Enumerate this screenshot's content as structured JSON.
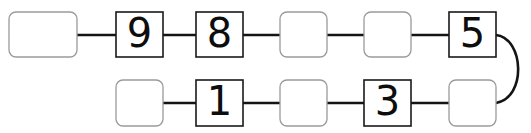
{
  "diagram": {
    "type": "linked-boxes-chain",
    "title": "",
    "canvas": {
      "width": 531,
      "height": 133,
      "background": "#ffffff"
    },
    "style": {
      "digit_border_color": "#1a1a1a",
      "empty_border_color": "#9a9a9a",
      "connector_color": "#141414",
      "box_fill": "#ffffff"
    },
    "rows": [
      {
        "name": "top-row",
        "y": 12,
        "height": 45,
        "cells": [
          {
            "index": 0,
            "value": "",
            "filled": false,
            "x": 9,
            "width": 68,
            "rounded": true,
            "label": "empty-box"
          },
          {
            "index": 1,
            "value": "9",
            "filled": true,
            "x": 116,
            "width": 47,
            "rounded": false,
            "label": "digit-box-9"
          },
          {
            "index": 2,
            "value": "8",
            "filled": true,
            "x": 196,
            "width": 47,
            "rounded": false,
            "label": "digit-box-8"
          },
          {
            "index": 3,
            "value": "",
            "filled": false,
            "x": 280,
            "width": 47,
            "rounded": true,
            "label": "empty-box"
          },
          {
            "index": 4,
            "value": "",
            "filled": false,
            "x": 364,
            "width": 47,
            "rounded": true,
            "label": "empty-box"
          },
          {
            "index": 5,
            "value": "5",
            "filled": true,
            "x": 449,
            "width": 47,
            "rounded": false,
            "label": "digit-box-5"
          }
        ]
      },
      {
        "name": "bottom-row",
        "y": 80,
        "height": 46,
        "cells": [
          {
            "index": 0,
            "value": "",
            "filled": false,
            "x": 116,
            "width": 47,
            "rounded": true,
            "label": "empty-box"
          },
          {
            "index": 1,
            "value": "1",
            "filled": true,
            "x": 196,
            "width": 47,
            "rounded": false,
            "label": "digit-box-1"
          },
          {
            "index": 2,
            "value": "",
            "filled": false,
            "x": 280,
            "width": 47,
            "rounded": true,
            "label": "empty-box"
          },
          {
            "index": 3,
            "value": "3",
            "filled": true,
            "x": 364,
            "width": 47,
            "rounded": false,
            "label": "digit-box-3"
          },
          {
            "index": 4,
            "value": "",
            "filled": false,
            "x": 449,
            "width": 47,
            "rounded": true,
            "label": "empty-box"
          }
        ]
      }
    ],
    "connectors": [
      {
        "name": "top-link-0-1",
        "x1": 77,
        "x2": 116,
        "y": 35
      },
      {
        "name": "top-link-1-2",
        "x1": 163,
        "x2": 196,
        "y": 35
      },
      {
        "name": "top-link-2-3",
        "x1": 243,
        "x2": 280,
        "y": 35
      },
      {
        "name": "top-link-3-4",
        "x1": 327,
        "x2": 364,
        "y": 35
      },
      {
        "name": "top-link-4-5",
        "x1": 411,
        "x2": 449,
        "y": 35
      },
      {
        "name": "bottom-link-0-1",
        "x1": 163,
        "x2": 196,
        "y": 103
      },
      {
        "name": "bottom-link-1-2",
        "x1": 243,
        "x2": 280,
        "y": 103
      },
      {
        "name": "bottom-link-2-3",
        "x1": 327,
        "x2": 364,
        "y": 103
      },
      {
        "name": "bottom-link-3-4",
        "x1": 411,
        "x2": 449,
        "y": 103
      }
    ],
    "wrap_connector": {
      "name": "wrap-around-connector",
      "from_x": 496,
      "from_y": 35,
      "to_x": 496,
      "to_y": 103,
      "path": "M 496 35 C 524 38 527 98 496 103"
    },
    "sequence_visible": [
      "",
      "9",
      "8",
      "",
      "",
      "5",
      "",
      "1",
      "",
      "3",
      ""
    ]
  }
}
